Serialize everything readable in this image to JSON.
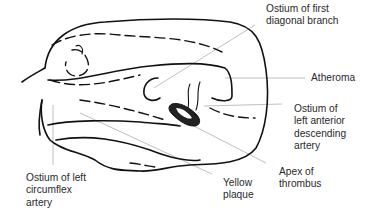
{
  "diagram": {
    "labels": {
      "first_diagonal": [
        "Ostium of first",
        "diagonal branch"
      ],
      "atheroma": [
        "Atheroma"
      ],
      "lad": [
        "Ostium of",
        "left anterior",
        "descending",
        "artery"
      ],
      "apex_thrombus": [
        "Apex of",
        "thrombus"
      ],
      "yellow_plaque": [
        "Yellow",
        "plaque"
      ],
      "circumflex": [
        "Ostium of left",
        "circumflex",
        "artery"
      ]
    }
  }
}
